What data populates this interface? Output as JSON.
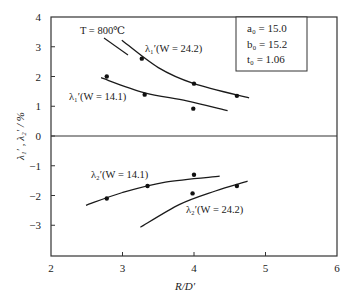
{
  "chart_data": {
    "type": "line",
    "title": "",
    "xlabel": "R/D′",
    "ylabel": "λ1′, λ2′ / %",
    "xlim": [
      2,
      6
    ],
    "ylim": [
      -4,
      4
    ],
    "xticks": [
      2,
      3,
      4,
      5,
      6
    ],
    "yticks": [
      4,
      3,
      2,
      1,
      0,
      -1,
      -2,
      -3
    ],
    "grid": false,
    "zero_line": true,
    "annotations": [
      {
        "text": "T = 800℃",
        "arrow_to": "λ1′ (W = 24.2) curve"
      }
    ],
    "legend_box": {
      "position": "top-right",
      "lines": [
        "a0 = 15.0",
        "b0 = 15.2",
        "t0 = 1.06"
      ]
    },
    "series": [
      {
        "name": "λ1′ (W = 24.2)",
        "points": [
          {
            "x": 3.27,
            "y": 2.6
          },
          {
            "x": 4.0,
            "y": 1.76
          },
          {
            "x": 4.6,
            "y": 1.35
          }
        ],
        "fit_curve": [
          {
            "x": 2.99,
            "y": 3.22
          },
          {
            "x": 3.5,
            "y": 2.3
          },
          {
            "x": 4.0,
            "y": 1.76
          },
          {
            "x": 4.77,
            "y": 1.28
          }
        ]
      },
      {
        "name": "λ1′ (W = 14.1)",
        "points": [
          {
            "x": 2.78,
            "y": 2.0
          },
          {
            "x": 3.31,
            "y": 1.39
          },
          {
            "x": 3.99,
            "y": 0.92
          }
        ],
        "fit_curve": [
          {
            "x": 2.7,
            "y": 1.96
          },
          {
            "x": 3.3,
            "y": 1.46
          },
          {
            "x": 3.9,
            "y": 1.18
          },
          {
            "x": 4.47,
            "y": 0.85
          }
        ]
      },
      {
        "name": "λ2′ (W = 14.1)",
        "points": [
          {
            "x": 2.78,
            "y": -2.1
          },
          {
            "x": 3.35,
            "y": -1.68
          },
          {
            "x": 4.0,
            "y": -1.3
          }
        ],
        "fit_curve": [
          {
            "x": 2.49,
            "y": -2.33
          },
          {
            "x": 3.0,
            "y": -1.9
          },
          {
            "x": 3.6,
            "y": -1.55
          },
          {
            "x": 4.36,
            "y": -1.35
          }
        ]
      },
      {
        "name": "λ2′ (W = 24.2)",
        "points": [
          {
            "x": 3.98,
            "y": -1.93
          },
          {
            "x": 4.6,
            "y": -1.68
          }
        ],
        "fit_curve": [
          {
            "x": 3.25,
            "y": -3.07
          },
          {
            "x": 3.8,
            "y": -2.3
          },
          {
            "x": 4.3,
            "y": -1.85
          },
          {
            "x": 4.75,
            "y": -1.52
          }
        ]
      }
    ],
    "series_labels": [
      {
        "text": "λ1′ (W = 24.2)",
        "near_x": 3.5,
        "near_y": 2.95
      },
      {
        "text": "λ1′ (W = 14.1)",
        "near_x": 2.55,
        "near_y": 1.25
      },
      {
        "text": "λ2′ (W = 14.1)",
        "near_x": 2.75,
        "near_y": -1.35
      },
      {
        "text": "λ2′ (W = 24.2)",
        "near_x": 4.25,
        "near_y": -2.25
      }
    ]
  },
  "labels": {
    "annotation_T": "T = 800℃",
    "legend_a0": "a₀ = 15.0",
    "legend_b0": "b₀ = 15.2",
    "legend_t0": "t₀ = 1.06",
    "lambda1_w242": "λ₁′(W = 24.2)",
    "lambda1_w141": "λ₁′(W = 14.1)",
    "lambda2_w141": "λ₂′(W = 14.1)",
    "lambda2_w242": "λ₂′(W = 24.2)",
    "xlabel": "R/D′",
    "ylabel": "λ₁′ , λ₂′ / %"
  },
  "style": {
    "line_color": "#1a1a1a",
    "axis_color": "#333333",
    "point_color": "#111111"
  }
}
